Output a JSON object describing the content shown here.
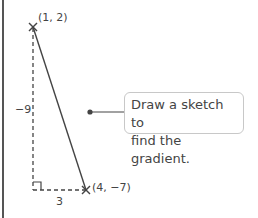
{
  "diagram": {
    "points": [
      {
        "label": "(1, 2)",
        "x": 1,
        "y": 2
      },
      {
        "label": "(4, −7)",
        "x": 4,
        "y": -7
      }
    ],
    "rise_label": "−9",
    "run_label": "3",
    "callout": {
      "line1": "Draw a sketch to",
      "line2": "find the gradient."
    },
    "colors": {
      "line": "#444444",
      "text": "#444444",
      "callout_border": "#c8c8c8"
    }
  }
}
